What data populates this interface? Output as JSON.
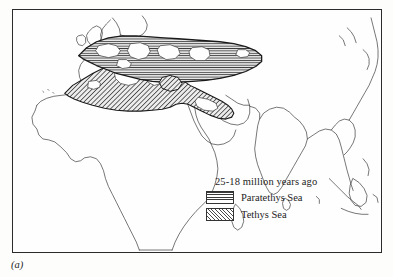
{
  "figure": {
    "caption": "(a)",
    "type": "paleogeographic-map"
  },
  "map": {
    "title": "",
    "frame": true,
    "background_color": "#fefefe",
    "coastline_color": "#333333",
    "regions": [
      {
        "name": "Paratethys Sea",
        "pattern": "horizontal-lines",
        "fill_color": "#d9d9d9",
        "outline_color": "#1a1a1a"
      },
      {
        "name": "Tethys Sea",
        "pattern": "diagonal-hatch",
        "fill_color": "#cccccc",
        "outline_color": "#1a1a1a"
      }
    ],
    "landmasses": [
      "Africa",
      "Europe",
      "Scandinavia",
      "British Isles",
      "Arabian Peninsula",
      "India",
      "Southeast Asia",
      "Sri Lanka",
      "Madagascar",
      "Indonesia"
    ]
  },
  "legend": {
    "title": "25-18 million years ago",
    "items": [
      {
        "label": "Paratethys Sea",
        "pattern": "horizontal-lines"
      },
      {
        "label": "Tethys Sea",
        "pattern": "diagonal-hatch"
      }
    ]
  }
}
